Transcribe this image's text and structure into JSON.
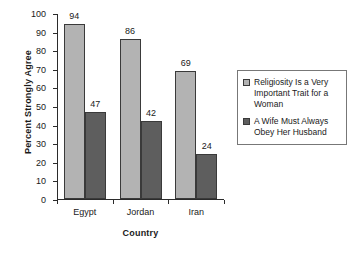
{
  "chart_data": {
    "type": "bar",
    "title": "",
    "xlabel": "Country",
    "ylabel": "Percent Strongly Agree",
    "categories": [
      "Egypt",
      "Jordan",
      "Iran"
    ],
    "series": [
      {
        "name": "Religiosity Is a Very Important Trait for a Woman",
        "color": "#b3b3b3",
        "values": [
          94,
          86,
          69
        ]
      },
      {
        "name": "A Wife Must Always Obey Her Husband",
        "color": "#5e5e5e",
        "values": [
          47,
          42,
          24
        ]
      }
    ],
    "ylim": [
      0,
      100
    ],
    "yticks": [
      0,
      10,
      20,
      30,
      40,
      50,
      60,
      70,
      80,
      90,
      100
    ],
    "grid": false,
    "legend_position": "right",
    "data_labels": true
  },
  "legend": {
    "entries": [
      {
        "label": "Religiosity Is  a  Very Important Trait for a Woman",
        "swatch": "legend-swatch-light"
      },
      {
        "label": "A Wife Must Always Obey Her Husband",
        "swatch": "legend-swatch-dark"
      }
    ]
  }
}
